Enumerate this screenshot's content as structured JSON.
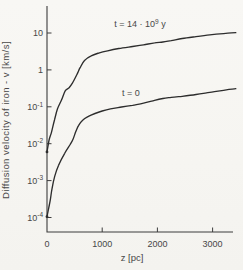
{
  "figure": {
    "background": "#f6f5f1",
    "ink": "#2d2d2d",
    "text_color": "#474747"
  },
  "chart_data": {
    "type": "line",
    "title": "",
    "xlabel": "z [pc]",
    "ylabel": "Diffusion velocity of iron - v [km/s]",
    "grid": false,
    "legend_position": "inline-annotations",
    "x_axis": {
      "scale": "linear",
      "min": 0,
      "max": 3420,
      "ticks": [
        0,
        1000,
        2000,
        3000
      ],
      "tick_labels": [
        "0",
        "1000",
        "2000",
        "3000"
      ]
    },
    "y_axis": {
      "scale": "log",
      "min": 0.0001,
      "max": 30,
      "ticks": [
        10,
        1,
        0.1,
        0.01,
        0.001,
        0.0001
      ],
      "tick_labels": [
        "10",
        "1",
        "10^{-1}",
        "10^{-2}",
        "10^{-3}",
        "10^{-4}"
      ]
    },
    "series": [
      {
        "name": "t = 14e9 y",
        "label": "t = 14 · 10^{9} y",
        "label_pos": {
          "x": 140,
          "y": 27
        },
        "points": [
          [
            0,
            0.006
          ],
          [
            40,
            0.013
          ],
          [
            80,
            0.02
          ],
          [
            135,
            0.044
          ],
          [
            190,
            0.088
          ],
          [
            265,
            0.155
          ],
          [
            330,
            0.27
          ],
          [
            400,
            0.33
          ],
          [
            460,
            0.44
          ],
          [
            540,
            0.74
          ],
          [
            600,
            1.15
          ],
          [
            680,
            1.8
          ],
          [
            800,
            2.4
          ],
          [
            950,
            2.9
          ],
          [
            1100,
            3.3
          ],
          [
            1300,
            3.8
          ],
          [
            1550,
            4.3
          ],
          [
            1750,
            4.8
          ],
          [
            1950,
            5.4
          ],
          [
            2100,
            5.7
          ],
          [
            2250,
            6.2
          ],
          [
            2450,
            7.1
          ],
          [
            2700,
            8.0
          ],
          [
            2950,
            8.9
          ],
          [
            3200,
            9.6
          ],
          [
            3420,
            10.2
          ]
        ]
      },
      {
        "name": "t = 0",
        "label": "t = 0",
        "label_pos": {
          "x": 131,
          "y": 96
        },
        "points": [
          [
            0,
            0.000105
          ],
          [
            30,
            0.00018
          ],
          [
            60,
            0.0003
          ],
          [
            90,
            0.0006
          ],
          [
            140,
            0.0013
          ],
          [
            210,
            0.0026
          ],
          [
            320,
            0.0055
          ],
          [
            420,
            0.0095
          ],
          [
            470,
            0.013
          ],
          [
            520,
            0.021
          ],
          [
            570,
            0.031
          ],
          [
            650,
            0.044
          ],
          [
            750,
            0.055
          ],
          [
            870,
            0.066
          ],
          [
            1000,
            0.077
          ],
          [
            1150,
            0.088
          ],
          [
            1350,
            0.099
          ],
          [
            1550,
            0.11
          ],
          [
            1750,
            0.125
          ],
          [
            1950,
            0.15
          ],
          [
            2100,
            0.168
          ],
          [
            2250,
            0.18
          ],
          [
            2450,
            0.193
          ],
          [
            2700,
            0.215
          ],
          [
            2950,
            0.245
          ],
          [
            3200,
            0.28
          ],
          [
            3420,
            0.31
          ]
        ]
      }
    ]
  }
}
